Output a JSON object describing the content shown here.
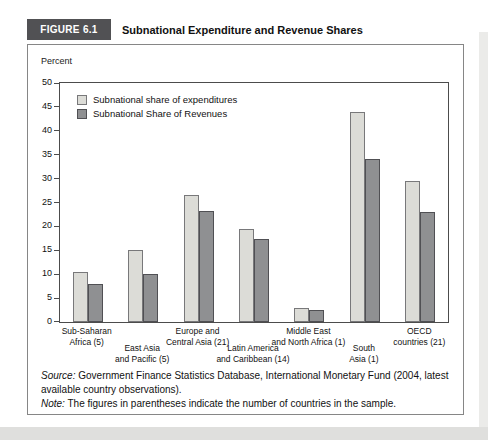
{
  "page": {
    "figure_label": "FIGURE 6.1",
    "title": "Subnational Expenditure and Revenue Shares"
  },
  "chart_data": {
    "type": "bar",
    "title": "Subnational Expenditure and Revenue Shares",
    "xlabel": "",
    "ylabel": "Percent",
    "ylim": [
      0,
      50
    ],
    "ytick_step": 5,
    "grid": false,
    "legend_position": "top-left-inside",
    "categories": [
      "Sub-Saharan\nAfrica (5)",
      "East Asia\nand Pacific (5)",
      "Europe and\nCentral Asia (21)",
      "Latin America\nand Caribbean (14)",
      "Middle East\nand North Africa (1)",
      "South\nAsia (1)",
      "OECD\ncountries (21)"
    ],
    "series": [
      {
        "name": "Subnational share of expenditures",
        "color": "#dcdcd7",
        "border_color": "#78787a",
        "values": [
          10.5,
          15,
          26.5,
          19.5,
          3,
          44,
          29.5
        ]
      },
      {
        "name": "Subnational Share of Revenues",
        "color": "#8f9092",
        "border_color": "#505054",
        "values": [
          8,
          10,
          23.3,
          17.3,
          2.5,
          34,
          23
        ]
      }
    ]
  },
  "notes": {
    "source_prefix": "Source:",
    "source_text": " Government Finance Statistics Database, International Monetary Fund (2004, latest available country observations).",
    "note_prefix": "Note:",
    "note_text": " The figures in parentheses indicate the number of countries in the sample."
  },
  "colors": {
    "figure_label_bg": "#515154",
    "figure_label_text": "#ffffff",
    "box_border": "#868686",
    "plot_border": "#4c4c4c"
  }
}
